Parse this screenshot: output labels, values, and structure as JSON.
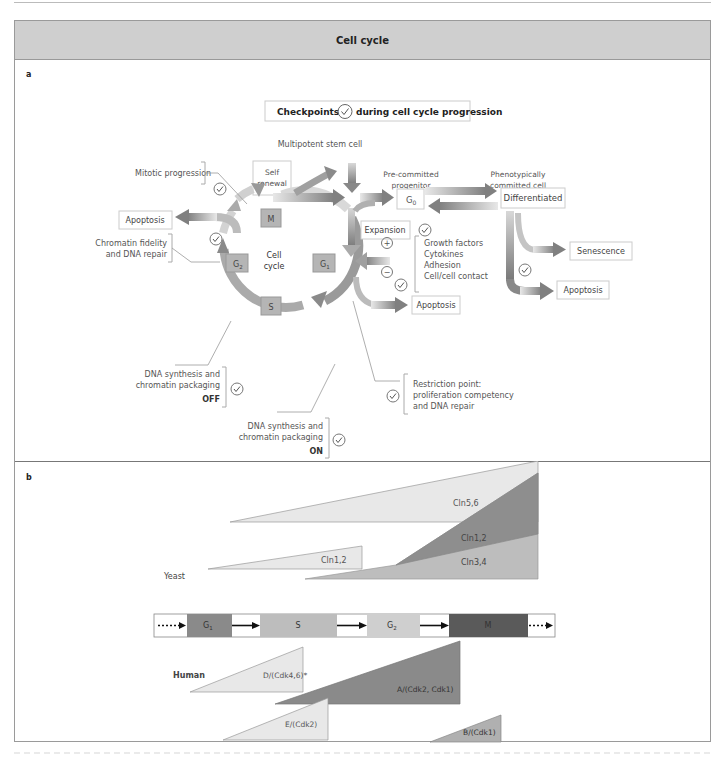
{
  "title": "Cell cycle",
  "panel_a": {
    "letter": "a",
    "legend": {
      "prefix": "Checkpoints",
      "icon": "check-circle-icon",
      "suffix": "during cell cycle progression"
    },
    "multipotent_label": "Multipotent stem cell",
    "self_renewal": [
      "Self",
      "renewal"
    ],
    "precommitted": [
      "Pre-committed",
      "progenitor"
    ],
    "phenotypic": [
      "Phenotypically",
      "committed cell"
    ],
    "g0": "G",
    "g0_sub": "0",
    "differentiated": "Differentiated",
    "expansion": "Expansion",
    "senescence": "Senescence",
    "apoptosis_left": "Apoptosis",
    "apoptosis_mid": "Apoptosis",
    "apoptosis_right": "Apoptosis",
    "cell_cycle": [
      "Cell",
      "cycle"
    ],
    "phases": {
      "M": "M",
      "G2": "G",
      "G2_sub": "2",
      "G1": "G",
      "G1_sub": "1",
      "S": "S"
    },
    "plus": "+",
    "minus": "−",
    "factors": [
      "Growth factors",
      "Cytokines",
      "Adhesion",
      "Cell/cell contact"
    ],
    "checkpoints": {
      "mitotic": "Mitotic progression",
      "chromatin": [
        "Chromatin fidelity",
        "and DNA repair"
      ],
      "dna_off": [
        "DNA synthesis and",
        "chromatin packaging",
        "OFF"
      ],
      "dna_on": [
        "DNA synthesis and",
        "chromatin packaging",
        "ON"
      ],
      "restriction": [
        "Restriction point:",
        "proliferation competency",
        "and DNA repair"
      ]
    }
  },
  "panel_b": {
    "letter": "b",
    "yeast_label": "Yeast",
    "human_label": "Human",
    "phase_bar": [
      {
        "label": "G",
        "sub": "1",
        "color": "#8a8a8a"
      },
      {
        "label": "S",
        "sub": "",
        "color": "#bdbdbd"
      },
      {
        "label": "G",
        "sub": "2",
        "color": "#cfcfcf"
      },
      {
        "label": "M",
        "sub": "",
        "color": "#5a5a5a"
      }
    ],
    "yeast_cyclins": [
      "Cln5,6",
      "Cln1,2",
      "Cln1,2",
      "Cln3,4"
    ],
    "human_cyclins": [
      "D/(Cdk4,6)*",
      "A/(Cdk2, Cdk1)",
      "E/(Cdk2)",
      "B/(Cdk1)"
    ]
  },
  "colors": {
    "light": "#e6e6e6",
    "mid": "#b5b5b5",
    "dark": "#8c8c8c",
    "darker": "#6e6e6e",
    "header": "#cfcfcf"
  }
}
